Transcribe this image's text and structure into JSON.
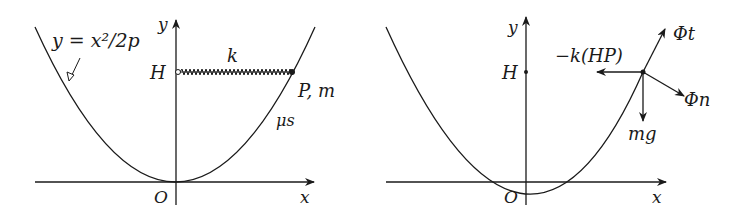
{
  "left_panel": {
    "axis_x_label": "x",
    "axis_y_label": "y",
    "origin_label": "O",
    "curve_equation": "y = x²/2p",
    "point_H_label": "H",
    "spring_label": "k",
    "particle_label": "P, m",
    "friction_label": "μs"
  },
  "right_panel": {
    "axis_x_label": "x",
    "axis_y_label": "y",
    "origin_label": "O",
    "point_H_label": "H",
    "forces": {
      "tangential": "Φt",
      "normal": "Φn",
      "gravity": "mg",
      "spring": "−k(HP)"
    }
  },
  "colors": {
    "ink": "#1a1a1a",
    "background": "#ffffff"
  }
}
